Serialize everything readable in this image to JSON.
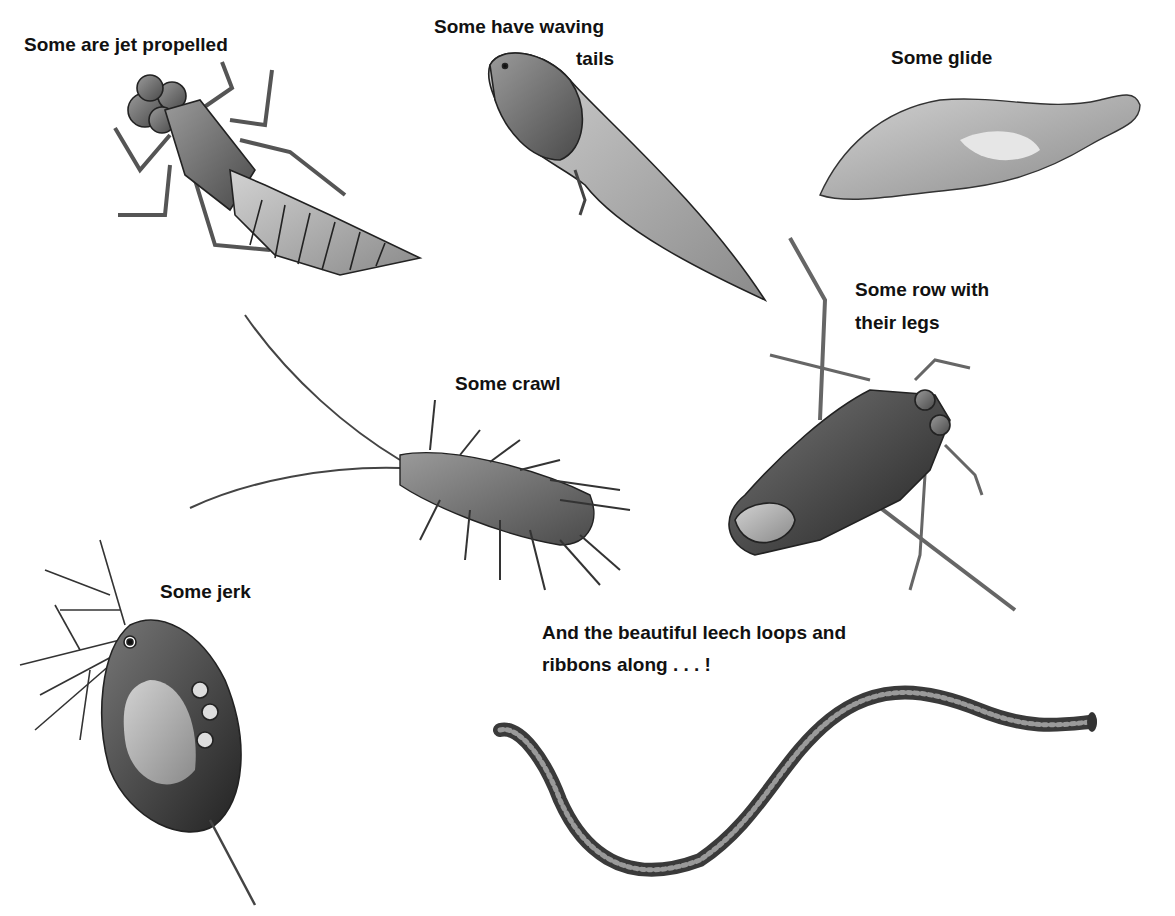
{
  "illustration": {
    "style": "grayscale pencil illustration on white background",
    "background_color": "#ffffff",
    "ink_color": "#111111",
    "captions": {
      "jet": "Some are jet propelled",
      "waving_line1": "Some have waving",
      "waving_line2": "tails",
      "glide": "Some glide",
      "row_line1": "Some row with",
      "row_line2": "their legs",
      "crawl": "Some crawl",
      "jerk": "Some jerk",
      "leech_line1": "And the beautiful leech loops and",
      "leech_line2": "ribbons along . . . !"
    },
    "creatures": [
      {
        "name": "dragonfly-nymph",
        "caption": "Some are jet propelled"
      },
      {
        "name": "tadpole",
        "caption": "Some have waving tails"
      },
      {
        "name": "flatworm",
        "caption": "Some glide"
      },
      {
        "name": "water-boatman",
        "caption": "Some row with their legs"
      },
      {
        "name": "water-louse",
        "caption": "Some crawl"
      },
      {
        "name": "water-flea",
        "caption": "Some jerk"
      },
      {
        "name": "leech",
        "caption": "And the beautiful leech loops and ribbons along . . . !"
      }
    ]
  }
}
